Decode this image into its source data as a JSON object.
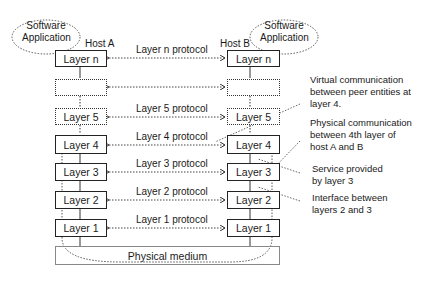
{
  "hosts": {
    "a": {
      "label": "Host A",
      "app_label_line1": "Software",
      "app_label_line2": "Application"
    },
    "b": {
      "label": "Host B",
      "app_label_line1": "Software",
      "app_label_line2": "Application"
    }
  },
  "layers": {
    "n": "Layer n",
    "blank": "",
    "l5": "Layer 5",
    "l4": "Layer 4",
    "l3": "Layer 3",
    "l2": "Layer 2",
    "l1": "Layer 1"
  },
  "protocols": {
    "n": "Layer n protocol",
    "l5": "Layer 5 protocol",
    "l4": "Layer 4 protocol",
    "l3": "Layer 3 protocol",
    "l2": "Layer 2 protocol",
    "l1": "Layer 1 protocol"
  },
  "medium": "Physical medium",
  "annotations": {
    "virtual": [
      "Virtual communication",
      "between peer entities at",
      "layer 4."
    ],
    "physical": [
      "Physical communication",
      "between 4th layer of",
      "host A and B"
    ],
    "service": [
      "Service provided",
      "by layer 3"
    ],
    "interface": [
      "Interface between",
      "layers 2 and 3"
    ]
  }
}
